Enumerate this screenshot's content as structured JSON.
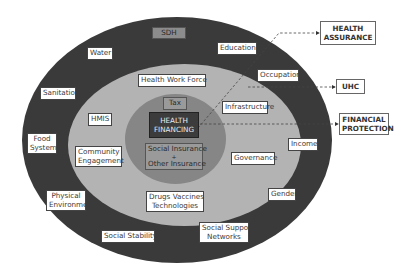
{
  "diagram": {
    "rings": {
      "outer": {
        "name": "SDH",
        "color": "#3a3a3a"
      },
      "middle": {
        "name": "Health System",
        "color": "#b2b2b2"
      },
      "inner": {
        "name": "Health Financing Core",
        "color": "#858585"
      }
    },
    "outer_ring_labels": {
      "sdh": "SDH",
      "water": "Water",
      "education": "Education",
      "sanitation": "Sanitation",
      "occupation": "Occupation",
      "food_systems_1": "Food",
      "food_systems_2": "Systems",
      "income": "Income",
      "physical_environment_1": "Physical",
      "physical_environment_2": "Environment",
      "gender": "Gender",
      "social_stability": "Social Stability",
      "social_support_1": "Social Support",
      "social_support_2": "Networks"
    },
    "middle_ring_labels": {
      "health_work_force": "Health Work Force",
      "hmis": "HMIS",
      "infrastructure": "Infrastructure",
      "community_engagement_1": "Community",
      "community_engagement_2": "Engagement",
      "governance": "Governance",
      "drugs_1": "Drugs Vaccines",
      "drugs_2": "Technologies"
    },
    "inner_labels": {
      "tax": "Tax",
      "health_financing_1": "HEALTH",
      "health_financing_2": "FINANCING",
      "insurance_1": "Social Insurance",
      "insurance_plus": "+",
      "insurance_2": "Other Insurance"
    },
    "outcomes": {
      "health_assurance_1": "HEALTH",
      "health_assurance_2": "ASSURANCE",
      "uhc": "UHC",
      "financial_protection_1": "FINANCIAL",
      "financial_protection_2": "PROTECTION"
    }
  }
}
